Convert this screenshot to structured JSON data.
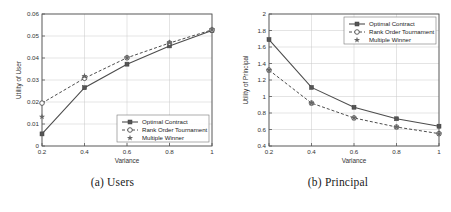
{
  "figure": {
    "panels": [
      {
        "caption": "(a) Users",
        "xlabel": "Variance",
        "ylabel": "Utility of User",
        "chart_data": {
          "type": "line",
          "title": "",
          "xlabel": "Variance",
          "ylabel": "Utility of User",
          "xlim": [
            0.2,
            1.0
          ],
          "ylim": [
            0,
            0.06
          ],
          "xticks": [
            0.2,
            0.4,
            0.6,
            0.8,
            1
          ],
          "xticklabels": [
            "0.2",
            "0.4",
            "0.6",
            "0.8",
            "1"
          ],
          "yticks": [
            0,
            0.01,
            0.02,
            0.03,
            0.04,
            0.05,
            0.06
          ],
          "yticklabels": [
            "0",
            "0.01",
            "0.02",
            "0.03",
            "0.04",
            "0.05",
            "0.06"
          ],
          "grid": true,
          "legend_position": "lower-right",
          "x": [
            0.2,
            0.4,
            0.6,
            0.8,
            1.0
          ],
          "series": [
            {
              "name": "Optimal Contract",
              "marker": "square",
              "line": "solid",
              "values": [
                0.0055,
                0.0265,
                0.0372,
                0.0455,
                0.0525
              ]
            },
            {
              "name": "Rank Order Tournament",
              "marker": "circle",
              "line": "dashed",
              "values": [
                0.0195,
                0.0308,
                0.0401,
                0.0468,
                0.0528
              ]
            },
            {
              "name": "Multiple Winner",
              "marker": "star",
              "line": "none",
              "values": [
                0.0133,
                0.0318,
                0.0402,
                0.0471,
                0.053
              ]
            }
          ]
        }
      },
      {
        "caption": "(b) Principal",
        "xlabel": "Variance",
        "ylabel": "Utility of Principal",
        "chart_data": {
          "type": "line",
          "title": "",
          "xlabel": "Variance",
          "ylabel": "Utility of Principal",
          "xlim": [
            0.2,
            1.0
          ],
          "ylim": [
            0.4,
            2.0
          ],
          "xticks": [
            0.2,
            0.4,
            0.6,
            0.8,
            1
          ],
          "xticklabels": [
            "0.2",
            "0.4",
            "0.6",
            "0.8",
            "1"
          ],
          "yticks": [
            0.4,
            0.6,
            0.8,
            1.0,
            1.2,
            1.4,
            1.6,
            1.8,
            2.0
          ],
          "yticklabels": [
            "0.4",
            "0.6",
            "0.8",
            "1",
            "1.2",
            "1.4",
            "1.6",
            "1.8",
            "2"
          ],
          "grid": true,
          "legend_position": "upper-right",
          "x": [
            0.2,
            0.4,
            0.6,
            0.8,
            1.0
          ],
          "series": [
            {
              "name": "Optimal Contract",
              "marker": "square",
              "line": "solid",
              "values": [
                1.69,
                1.11,
                0.87,
                0.73,
                0.64
              ]
            },
            {
              "name": "Rank Order Tournament",
              "marker": "circle",
              "line": "dashed",
              "values": [
                1.32,
                0.92,
                0.74,
                0.63,
                0.55
              ]
            },
            {
              "name": "Multiple Winner",
              "marker": "star",
              "line": "none",
              "values": [
                1.32,
                0.92,
                0.74,
                0.63,
                0.55
              ]
            }
          ]
        }
      }
    ],
    "colors": {
      "line": "#4d4d4d",
      "grid": "#c8c8c8",
      "axis": "#555555",
      "background": "#ffffff"
    }
  }
}
